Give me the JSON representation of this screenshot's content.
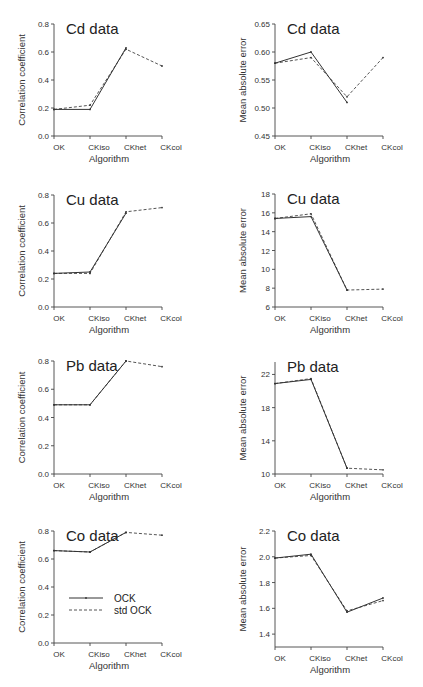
{
  "chart_data": [
    {
      "id": "cd-corr",
      "type": "line",
      "title": "Cd data",
      "xlabel": "Algorithm",
      "ylabel": "Correlation coefficient",
      "categories": [
        "OK",
        "CKiso",
        "CKhet",
        "CKcol"
      ],
      "yticks": [
        "0.0",
        "0.2",
        "0.4",
        "0.6",
        "0.8"
      ],
      "ylim": [
        0.0,
        0.8
      ],
      "series": [
        {
          "name": "OCK",
          "values": [
            0.19,
            0.19,
            0.63,
            null
          ]
        },
        {
          "name": "std OCK",
          "values": [
            0.19,
            0.22,
            0.62,
            0.5
          ]
        }
      ]
    },
    {
      "id": "cd-mae",
      "type": "line",
      "title": "Cd data",
      "xlabel": "Algorithm",
      "ylabel": "Mean absolute error",
      "categories": [
        "OK",
        "CKiso",
        "CKhet",
        "CKcol"
      ],
      "yticks": [
        "0.45",
        "0.50",
        "0.55",
        "0.60",
        "0.65"
      ],
      "ylim": [
        0.45,
        0.65
      ],
      "series": [
        {
          "name": "OCK",
          "values": [
            0.58,
            0.6,
            0.51,
            null
          ]
        },
        {
          "name": "std OCK",
          "values": [
            0.58,
            0.59,
            0.52,
            0.59
          ]
        }
      ]
    },
    {
      "id": "cu-corr",
      "type": "line",
      "title": "Cu data",
      "xlabel": "Algorithm",
      "ylabel": "Correlation coefficient",
      "categories": [
        "OK",
        "CKiso",
        "CKhet",
        "CKcol"
      ],
      "yticks": [
        "0.0",
        "0.2",
        "0.4",
        "0.6",
        "0.8"
      ],
      "ylim": [
        0.0,
        0.8
      ],
      "series": [
        {
          "name": "OCK",
          "values": [
            0.24,
            0.25,
            0.67,
            null
          ]
        },
        {
          "name": "std OCK",
          "values": [
            0.24,
            0.24,
            0.68,
            0.71
          ]
        }
      ]
    },
    {
      "id": "cu-mae",
      "type": "line",
      "title": "Cu data",
      "xlabel": "Algorithm",
      "ylabel": "Mean absolute error",
      "categories": [
        "OK",
        "CKiso",
        "CKhet",
        "CKcol"
      ],
      "yticks": [
        "6",
        "8",
        "10",
        "12",
        "14",
        "16",
        "18"
      ],
      "ylim": [
        6,
        18
      ],
      "series": [
        {
          "name": "OCK",
          "values": [
            15.4,
            15.6,
            7.8,
            null
          ]
        },
        {
          "name": "std OCK",
          "values": [
            15.4,
            15.9,
            7.8,
            7.9
          ]
        }
      ]
    },
    {
      "id": "pb-corr",
      "type": "line",
      "title": "Pb data",
      "xlabel": "Algorithm",
      "ylabel": "Correlation coefficient",
      "categories": [
        "OK",
        "CKiso",
        "CKhet",
        "CKcol"
      ],
      "yticks": [
        "0.0",
        "0.2",
        "0.4",
        "0.6",
        "0.8"
      ],
      "ylim": [
        0.0,
        0.8
      ],
      "series": [
        {
          "name": "OCK",
          "values": [
            0.49,
            0.49,
            0.8,
            null
          ]
        },
        {
          "name": "std OCK",
          "values": [
            0.49,
            0.49,
            0.8,
            0.76
          ]
        }
      ]
    },
    {
      "id": "pb-mae",
      "type": "line",
      "title": "Pb data",
      "xlabel": "Algorithm",
      "ylabel": "Mean absolute error",
      "categories": [
        "OK",
        "CKiso",
        "CKhet",
        "CKcol"
      ],
      "yticks": [
        "10",
        "14",
        "18",
        "22"
      ],
      "ylim": [
        10,
        23.5
      ],
      "series": [
        {
          "name": "OCK",
          "values": [
            20.9,
            21.4,
            10.7,
            null
          ]
        },
        {
          "name": "std OCK",
          "values": [
            20.9,
            21.5,
            10.7,
            10.5
          ]
        }
      ]
    },
    {
      "id": "co-corr",
      "type": "line",
      "title": "Co data",
      "xlabel": "Algorithm",
      "ylabel": "Correlation coefficient",
      "categories": [
        "OK",
        "CKiso",
        "CKhet",
        "CKcol"
      ],
      "yticks": [
        "0.0",
        "0.2",
        "0.4",
        "0.6",
        "0.8"
      ],
      "ylim": [
        0.0,
        0.8
      ],
      "legend": {
        "position": "center-left",
        "entries": [
          "OCK",
          "std OCK"
        ]
      },
      "series": [
        {
          "name": "OCK",
          "values": [
            0.66,
            0.65,
            0.79,
            null
          ]
        },
        {
          "name": "std OCK",
          "values": [
            0.66,
            0.65,
            0.79,
            0.77
          ]
        }
      ]
    },
    {
      "id": "co-mae",
      "type": "line",
      "title": "Co data",
      "xlabel": "Algorithm",
      "ylabel": "Mean absolute error",
      "categories": [
        "OK",
        "CKiso",
        "CKhet",
        "CKcol"
      ],
      "yticks": [
        "1.4",
        "1.6",
        "1.8",
        "2.0",
        "2.2"
      ],
      "ylim": [
        1.3,
        2.2
      ],
      "series": [
        {
          "name": "OCK",
          "values": [
            1.99,
            2.02,
            1.57,
            1.68
          ]
        },
        {
          "name": "std OCK",
          "values": [
            1.99,
            2.01,
            1.58,
            1.66
          ]
        }
      ]
    }
  ],
  "legend": {
    "ock_label": "OCK",
    "std_label": "std OCK"
  },
  "colors": {
    "ock": "#333333",
    "std": "#555555",
    "axis": "#444444"
  }
}
